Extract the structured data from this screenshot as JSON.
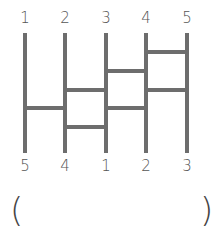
{
  "diagram": {
    "type": "amidakuji-ladder",
    "top_labels": [
      "1",
      "2",
      "3",
      "4",
      "5"
    ],
    "bottom_labels": [
      "5",
      "4",
      "1",
      "2",
      "3"
    ],
    "rungs": [
      {
        "between": [
          4,
          5
        ],
        "y": 52
      },
      {
        "between": [
          3,
          4
        ],
        "y": 71
      },
      {
        "between": [
          4,
          5
        ],
        "y": 90
      },
      {
        "between": [
          2,
          3
        ],
        "y": 90
      },
      {
        "between": [
          1,
          2
        ],
        "y": 108
      },
      {
        "between": [
          3,
          4
        ],
        "y": 108
      },
      {
        "between": [
          2,
          3
        ],
        "y": 127
      }
    ],
    "answer": {
      "open": "(",
      "close": ")",
      "value": ""
    },
    "line_color": "#6d6d6d",
    "text_color": "#555555"
  }
}
